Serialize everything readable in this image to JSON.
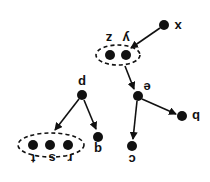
{
  "diagram": {
    "type": "directed-tree",
    "orientation": "rotated-180",
    "colors": {
      "node": "#111111",
      "edge": "#111111",
      "background": "#ffffff"
    },
    "nodes": [
      {
        "id": "x",
        "label": "x",
        "x": 164,
        "y": 25,
        "lx": 178,
        "ly": 26
      },
      {
        "id": "y",
        "label": "y",
        "x": 126,
        "y": 55,
        "lx": 126,
        "ly": 38
      },
      {
        "id": "z",
        "label": "z",
        "x": 110,
        "y": 55,
        "lx": 109,
        "ly": 38
      },
      {
        "id": "e",
        "label": "e",
        "x": 138,
        "y": 96,
        "lx": 147,
        "ly": 87
      },
      {
        "id": "b",
        "label": "b",
        "x": 182,
        "y": 116,
        "lx": 196,
        "ly": 116
      },
      {
        "id": "c",
        "label": "c",
        "x": 132,
        "y": 146,
        "lx": 132,
        "ly": 159
      },
      {
        "id": "p",
        "label": "p",
        "x": 82,
        "y": 95,
        "lx": 82,
        "ly": 82
      },
      {
        "id": "q",
        "label": "q",
        "x": 98,
        "y": 137,
        "lx": 98,
        "ly": 149
      },
      {
        "id": "r",
        "label": "r",
        "x": 68,
        "y": 145,
        "lx": 70,
        "ly": 158
      },
      {
        "id": "s",
        "label": "s",
        "x": 50,
        "y": 145,
        "lx": 52,
        "ly": 158
      },
      {
        "id": "t",
        "label": "t",
        "x": 33,
        "y": 145,
        "lx": 33,
        "ly": 158
      }
    ],
    "groups": [
      {
        "id": "yz-group",
        "members": [
          "y",
          "z"
        ],
        "cx": 118,
        "cy": 55,
        "rx": 22,
        "ry": 10
      },
      {
        "id": "rst-group",
        "members": [
          "r",
          "s",
          "t"
        ],
        "cx": 51,
        "cy": 145,
        "rx": 33,
        "ry": 12
      }
    ],
    "edges": [
      {
        "from": "x",
        "to": "yz-group",
        "x1": 160,
        "y1": 28,
        "x2": 131,
        "y2": 48
      },
      {
        "from": "yz-group",
        "to": "e",
        "x1": 125,
        "y1": 66,
        "x2": 134,
        "y2": 89
      },
      {
        "from": "e",
        "to": "b",
        "x1": 142,
        "y1": 99,
        "x2": 176,
        "y2": 114
      },
      {
        "from": "e",
        "to": "c",
        "x1": 137,
        "y1": 101,
        "x2": 133,
        "y2": 139
      },
      {
        "from": "p",
        "to": "rst-group",
        "x1": 79,
        "y1": 99,
        "x2": 55,
        "y2": 130
      },
      {
        "from": "p",
        "to": "q",
        "x1": 84,
        "y1": 100,
        "x2": 96,
        "y2": 129
      }
    ]
  }
}
